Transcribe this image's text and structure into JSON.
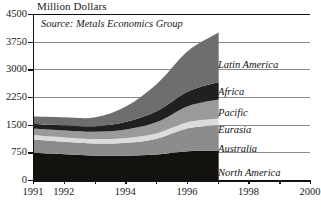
{
  "chart_data": {
    "type": "area",
    "title": "Million Dollars",
    "subtitle": "",
    "xlabel": "",
    "ylabel": "Million Dollars",
    "annotation": "Source: Metals Economics Group",
    "stacked": true,
    "grid": true,
    "legend_position": "inline-right",
    "x": [
      1991,
      1992,
      1993,
      1994,
      1995,
      1996,
      1997
    ],
    "xlim": [
      1991,
      2000
    ],
    "ylim": [
      0,
      4500
    ],
    "xticks": [
      1991,
      1992,
      1993,
      1994,
      1995,
      1996,
      1997,
      1998,
      1999,
      2000
    ],
    "xtick_labels": [
      "1991",
      "1992",
      "",
      "1994",
      "",
      "1996",
      "",
      "1998",
      "",
      "2000"
    ],
    "yticks": [
      0,
      750,
      1500,
      2250,
      3000,
      3750,
      4500
    ],
    "ytick_labels": [
      "0",
      "750",
      "1500",
      "2250",
      "3000",
      "3750",
      "4500"
    ],
    "series": [
      {
        "name": "North America",
        "color": "#14120f",
        "values": [
          740,
          700,
          660,
          660,
          690,
          780,
          790
        ]
      },
      {
        "name": "Australia",
        "color": "#8c8c8c",
        "values": [
          360,
          340,
          330,
          350,
          430,
          620,
          700
        ]
      },
      {
        "name": "Eurasia",
        "color": "#dcdcdc",
        "values": [
          110,
          115,
          120,
          130,
          150,
          170,
          180
        ]
      },
      {
        "name": "Pacific",
        "color": "#9a9a9a",
        "values": [
          180,
          190,
          200,
          230,
          300,
          430,
          510
        ]
      },
      {
        "name": "Africa",
        "color": "#20201e",
        "values": [
          130,
          140,
          150,
          210,
          300,
          400,
          480
        ]
      },
      {
        "name": "Latin America",
        "color": "#6e6e6e",
        "values": [
          200,
          215,
          240,
          420,
          740,
          1100,
          1340
        ]
      }
    ],
    "series_totals": [
      1720,
      1700,
      1700,
      2000,
      2610,
      3500,
      4000
    ]
  },
  "series_labels": [
    {
      "name": "Latin America",
      "label": "Latin America"
    },
    {
      "name": "Africa",
      "label": "Africa"
    },
    {
      "name": "Pacific",
      "label": "Pacific"
    },
    {
      "name": "Eurasia",
      "label": "Eurasia"
    },
    {
      "name": "Australia",
      "label": "Australia"
    },
    {
      "name": "North America",
      "label": "North America"
    }
  ]
}
